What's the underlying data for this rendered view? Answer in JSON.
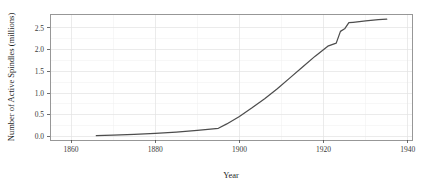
{
  "figure": {
    "background_color": "#ffffff",
    "panel_border_color": "#8c8c8c",
    "grid_color": "#e2e2e2",
    "line_color": "#4d4d4d"
  },
  "chart_data": {
    "type": "line",
    "title": "",
    "xlabel": "Year",
    "ylabel": "Number of Active Spindles (millions)",
    "xlim": [
      1855,
      1941
    ],
    "ylim": [
      -0.08,
      2.82
    ],
    "xticks": [
      1860,
      1880,
      1900,
      1920,
      1940
    ],
    "xtick_labels": [
      "1860",
      "1880",
      "1900",
      "1920",
      "1940"
    ],
    "yticks": [
      0.0,
      0.5,
      1.0,
      1.5,
      2.0,
      2.5
    ],
    "ytick_labels": [
      "0.0",
      "0.5",
      "1.0",
      "1.5",
      "2.0",
      "2.5"
    ],
    "grid": true,
    "legend": null,
    "series": [
      {
        "name": "Active Spindles",
        "color": "#4d4d4d",
        "x": [
          1866,
          1870,
          1875,
          1880,
          1885,
          1890,
          1895,
          1897,
          1900,
          1903,
          1906,
          1909,
          1912,
          1915,
          1918,
          1921,
          1923,
          1924,
          1925,
          1926,
          1927,
          1930,
          1933,
          1935
        ],
        "y": [
          0.02,
          0.03,
          0.05,
          0.07,
          0.1,
          0.14,
          0.19,
          0.29,
          0.46,
          0.66,
          0.87,
          1.1,
          1.35,
          1.6,
          1.85,
          2.08,
          2.15,
          2.42,
          2.48,
          2.62,
          2.63,
          2.66,
          2.69,
          2.7
        ]
      }
    ]
  },
  "axis_titles": {
    "x": "Year",
    "y": "Number of Active Spindles (millions)"
  }
}
